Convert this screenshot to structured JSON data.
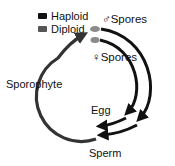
{
  "legend": {
    "items": [
      {
        "label": "Haploid",
        "color": "#111111"
      },
      {
        "label": "Diploid",
        "color": "#555555"
      }
    ]
  },
  "labels": {
    "male_spores": "♂Spores",
    "female_spores": "♀Spores",
    "sporophyte": "Sporophyte",
    "egg": "Egg",
    "sperm": "Sperm"
  },
  "colors": {
    "haploid": "#111111",
    "diploid": "#3a3a3a",
    "spore": "#8a8a8a"
  }
}
